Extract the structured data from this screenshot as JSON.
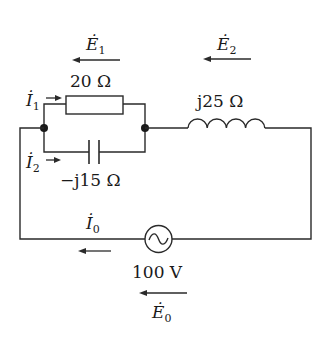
{
  "diagram": {
    "type": "ac-circuit",
    "components": {
      "resistor": {
        "label": "20 Ω",
        "value": "20 Ω"
      },
      "capacitor": {
        "label": "−j15 Ω",
        "value": "−j15 Ω"
      },
      "inductor": {
        "label": "j25 Ω",
        "value": "j25 Ω"
      },
      "source": {
        "label": "100 V",
        "value": "100 V"
      }
    },
    "currents": {
      "I1": {
        "symbol": "İ",
        "subscript": "1"
      },
      "I2": {
        "symbol": "İ",
        "subscript": "2"
      },
      "I0": {
        "symbol": "İ",
        "subscript": "0"
      }
    },
    "voltages": {
      "E1": {
        "symbol": "Ė",
        "subscript": "1"
      },
      "E2": {
        "symbol": "Ė",
        "subscript": "2"
      },
      "E0": {
        "symbol": "Ė",
        "subscript": "0"
      }
    },
    "colors": {
      "line": "#2a2a2a",
      "background": "#ffffff"
    }
  }
}
